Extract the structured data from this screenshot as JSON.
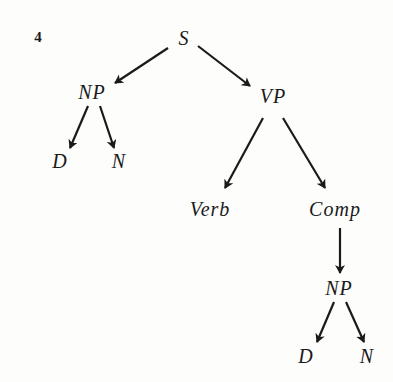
{
  "figure": {
    "number": "4",
    "number_pos": {
      "x": 38,
      "y": 37
    },
    "colors": {
      "ink": "#1a1a1a",
      "background": "#fdfdfc"
    }
  },
  "tree": {
    "nodes": [
      {
        "id": "s",
        "label": "S",
        "x": 184,
        "y": 38
      },
      {
        "id": "np1",
        "label": "NP",
        "x": 92,
        "y": 92
      },
      {
        "id": "vp",
        "label": "VP",
        "x": 273,
        "y": 96
      },
      {
        "id": "d1",
        "label": "D",
        "x": 60,
        "y": 161
      },
      {
        "id": "n1",
        "label": "N",
        "x": 119,
        "y": 161
      },
      {
        "id": "verb",
        "label": "Verb",
        "x": 210,
        "y": 209
      },
      {
        "id": "comp",
        "label": "Comp",
        "x": 335,
        "y": 209
      },
      {
        "id": "np2",
        "label": "NP",
        "x": 339,
        "y": 288
      },
      {
        "id": "d2",
        "label": "D",
        "x": 306,
        "y": 356
      },
      {
        "id": "n2",
        "label": "N",
        "x": 367,
        "y": 356
      }
    ],
    "edges": [
      {
        "from": "s",
        "to": "np1",
        "x1": 168,
        "y1": 48,
        "x2": 115,
        "y2": 83
      },
      {
        "from": "s",
        "to": "vp",
        "x1": 198,
        "y1": 46,
        "x2": 250,
        "y2": 86
      },
      {
        "from": "np1",
        "to": "d1",
        "x1": 88,
        "y1": 106,
        "x2": 70,
        "y2": 148
      },
      {
        "from": "np1",
        "to": "n1",
        "x1": 100,
        "y1": 106,
        "x2": 114,
        "y2": 148
      },
      {
        "from": "vp",
        "to": "verb",
        "x1": 263,
        "y1": 118,
        "x2": 225,
        "y2": 188
      },
      {
        "from": "vp",
        "to": "comp",
        "x1": 283,
        "y1": 118,
        "x2": 325,
        "y2": 188
      },
      {
        "from": "comp",
        "to": "np2",
        "x1": 340,
        "y1": 228,
        "x2": 340,
        "y2": 273
      },
      {
        "from": "np2",
        "to": "d2",
        "x1": 334,
        "y1": 302,
        "x2": 317,
        "y2": 342
      },
      {
        "from": "np2",
        "to": "n2",
        "x1": 346,
        "y1": 302,
        "x2": 364,
        "y2": 342
      }
    ]
  }
}
